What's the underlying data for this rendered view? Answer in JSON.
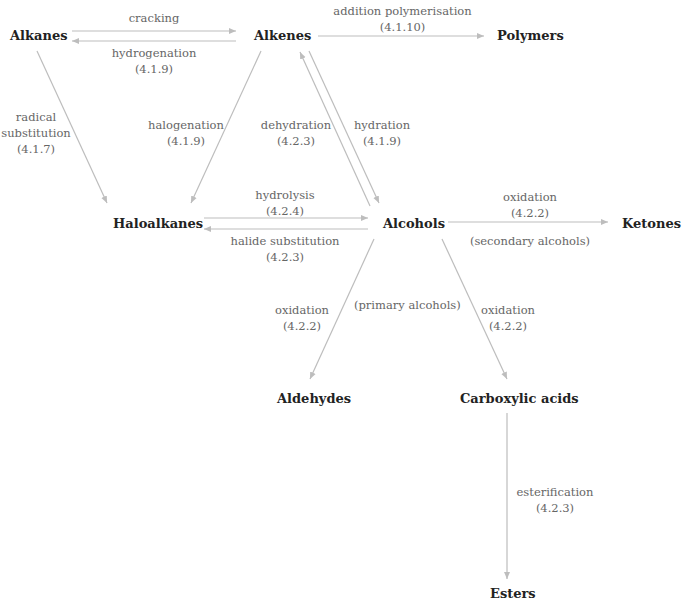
{
  "diagram": {
    "title": "",
    "colors": {
      "node_text": "#222222",
      "label_text": "#666666",
      "arrow": "#bdbdbd"
    },
    "nodes": {
      "alkanes": "Alkanes",
      "alkenes": "Alkenes",
      "polymers": "Polymers",
      "haloalkanes": "Haloalkanes",
      "alcohols": "Alcohols",
      "ketones": "Ketones",
      "aldehydes": "Aldehydes",
      "carboxylic_acids": "Carboxylic acids",
      "esters": "Esters"
    },
    "edges": {
      "cracking": {
        "from": "Alkanes",
        "to": "Alkenes",
        "name": "cracking",
        "ref": ""
      },
      "hydrogenation": {
        "from": "Alkenes",
        "to": "Alkanes",
        "name": "hydrogenation",
        "ref": "(4.1.9)"
      },
      "addition_polymerisation": {
        "from": "Alkenes",
        "to": "Polymers",
        "name": "addition polymerisation",
        "ref": "(4.1.10)"
      },
      "radical_substitution": {
        "from": "Alkanes",
        "to": "Haloalkanes",
        "name1": "radical",
        "name2": "substitution",
        "ref": "(4.1.7)"
      },
      "halogenation": {
        "from": "Alkenes",
        "to": "Haloalkanes",
        "name": "halogenation",
        "ref": "(4.1.9)"
      },
      "dehydration": {
        "from": "Alcohols",
        "to": "Alkenes",
        "name": "dehydration",
        "ref": "(4.2.3)"
      },
      "hydration": {
        "from": "Alkenes",
        "to": "Alcohols",
        "name": "hydration",
        "ref": "(4.1.9)"
      },
      "hydrolysis": {
        "from": "Haloalkanes",
        "to": "Alcohols",
        "name": "hydrolysis",
        "ref": "(4.2.4)"
      },
      "halide_substitution": {
        "from": "Alcohols",
        "to": "Haloalkanes",
        "name": "halide substitution",
        "ref": "(4.2.3)"
      },
      "oxidation_ketones": {
        "from": "Alcohols",
        "to": "Ketones",
        "name": "oxidation",
        "ref": "(4.2.2)",
        "note": "(secondary alcohols)"
      },
      "oxidation_aldehydes": {
        "from": "Alcohols",
        "to": "Aldehydes",
        "name": "oxidation",
        "ref": "(4.2.2)"
      },
      "primary_note": "(primary alcohols)",
      "oxidation_acids": {
        "from": "Alcohols",
        "to": "Carboxylic acids",
        "name": "oxidation",
        "ref": "(4.2.2)"
      },
      "esterification": {
        "from": "Carboxylic acids",
        "to": "Esters",
        "name": "esterification",
        "ref": "(4.2.3)"
      }
    }
  }
}
